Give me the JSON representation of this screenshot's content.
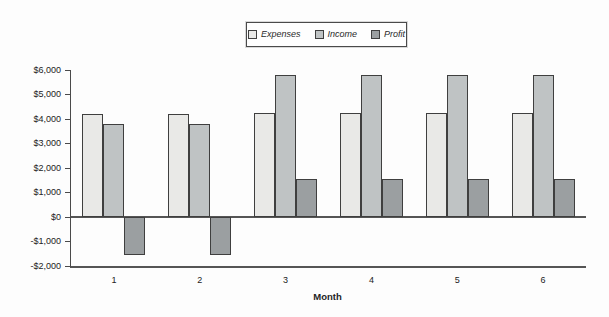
{
  "chart_data": {
    "type": "bar",
    "title": "",
    "xlabel": "Month",
    "ylabel": "",
    "categories": [
      "1",
      "2",
      "3",
      "4",
      "5",
      "6"
    ],
    "series": [
      {
        "name": "Expenses",
        "color": "#e9e9e7",
        "values": [
          4200,
          4200,
          4250,
          4250,
          4250,
          4250
        ]
      },
      {
        "name": "Income",
        "color": "#bfc3c4",
        "values": [
          3800,
          3800,
          5800,
          5800,
          5800,
          5800
        ]
      },
      {
        "name": "Profit",
        "color": "#9b9fa1",
        "values": [
          -1550,
          -1550,
          1550,
          1550,
          1550,
          1550
        ]
      }
    ],
    "ylim": [
      -2000,
      6000
    ],
    "y_ticks": [
      {
        "value": 6000,
        "label": "$6,000"
      },
      {
        "value": 5000,
        "label": "$5,000"
      },
      {
        "value": 4000,
        "label": "$4,000"
      },
      {
        "value": 3000,
        "label": "$3,000"
      },
      {
        "value": 2000,
        "label": "$2,000"
      },
      {
        "value": 1000,
        "label": "$1,000"
      },
      {
        "value": 0,
        "label": "$0"
      },
      {
        "value": -1000,
        "label": "-$1,000"
      },
      {
        "value": -2000,
        "label": "-$2,000"
      }
    ],
    "grid": false,
    "legend_position": "top-center",
    "colors": {
      "bar_border": "#3f3f3f",
      "axis": "#4a4a4a",
      "zero_line": "#555555",
      "text": "#222222",
      "background": "#fdfdfd"
    }
  }
}
